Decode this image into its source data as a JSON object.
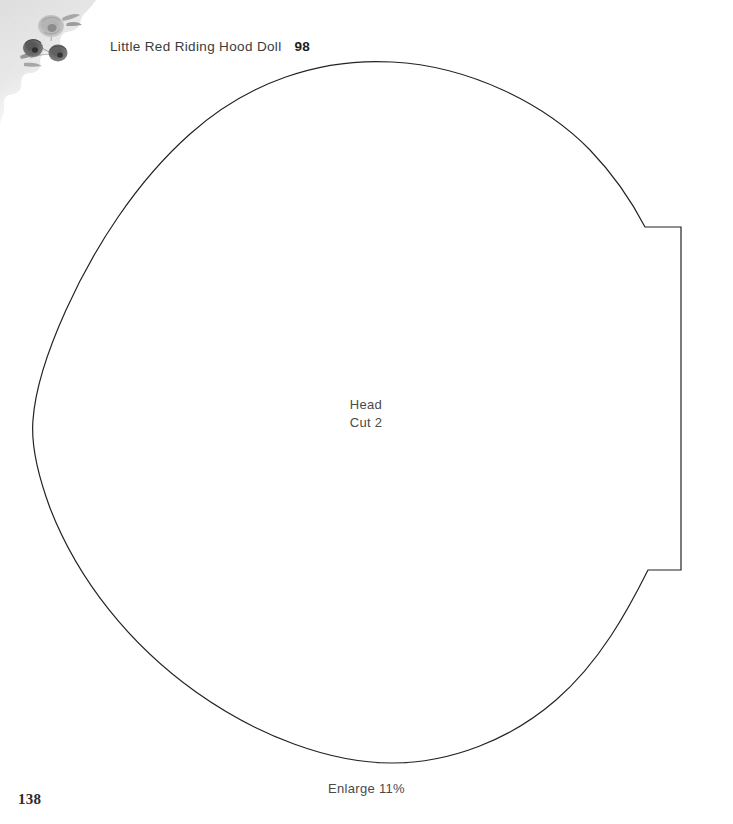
{
  "page": {
    "background_color": "#ffffff",
    "page_number": "138",
    "width": 733,
    "height": 824
  },
  "header": {
    "title": "Little Red Riding Hood Doll",
    "pattern_number": "98",
    "title_color": "#3b3b3b",
    "number_color": "#1d1d1d"
  },
  "decoration": {
    "corner_icon_name": "torn-paper-floral-corner",
    "description": "torn paper edge with faded floral illustration",
    "paper_color": "#e2e2e2",
    "floral_color": "#6f6f6f"
  },
  "pattern_piece": {
    "name": "Head",
    "cut_instruction": "Cut 2",
    "outline_color": "#232323",
    "outline_width": 1.2,
    "fill": "none",
    "label_color": "#4a4a4a"
  },
  "notes": {
    "enlarge": "Enlarge 11%",
    "color": "#4a4a4a"
  }
}
